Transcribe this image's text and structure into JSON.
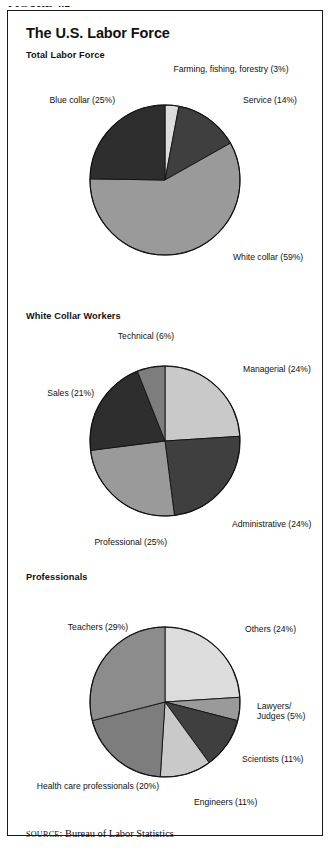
{
  "figure_kicker": "FIGURE 4.2",
  "title": "The U.S. Labor Force",
  "source": {
    "prefix": "SOURCE",
    "separator": ": ",
    "text": "Bureau of Labor Statistics"
  },
  "palette": {
    "very_light": "#dcdcdc",
    "light": "#c9c9c9",
    "medium": "#9a9a9a",
    "medium_dark": "#7d7d7d",
    "dark": "#3f3f3f",
    "very_dark": "#2e2e2e",
    "outline": "#111111"
  },
  "chart_data": [
    {
      "type": "pie",
      "title": "Total Labor Force",
      "start_angle": 0,
      "direction": "clockwise",
      "categories": [
        "Farming, fishing, forestry",
        "Service",
        "White collar",
        "Blue collar"
      ],
      "values": [
        3,
        14,
        59,
        25
      ],
      "labels": [
        "Farming, fishing, forestry (3%)",
        "Service (14%)",
        "White collar (59%)",
        "Blue collar (25%)"
      ],
      "colors": [
        "#dcdcdc",
        "#3f3f3f",
        "#9a9a9a",
        "#2e2e2e"
      ],
      "label_positions": [
        {
          "side": "center",
          "x": 136,
          "y": 2,
          "w": 190
        },
        {
          "side": "right",
          "x": 243,
          "y": 33,
          "w": 85
        },
        {
          "side": "right",
          "x": 233,
          "y": 190,
          "w": 95
        },
        {
          "side": "left",
          "x": 10,
          "y": 33,
          "w": 105
        }
      ]
    },
    {
      "type": "pie",
      "title": "White Collar Workers",
      "start_angle": 0,
      "direction": "clockwise",
      "categories": [
        "Managerial",
        "Administrative",
        "Professional",
        "Sales",
        "Technical"
      ],
      "values": [
        24,
        24,
        25,
        21,
        6
      ],
      "labels": [
        "Managerial (24%)",
        "Administrative (24%)",
        "Professional (25%)",
        "Sales (21%)",
        "Technical (6%)"
      ],
      "colors": [
        "#c9c9c9",
        "#3f3f3f",
        "#9a9a9a",
        "#2e2e2e",
        "#7d7d7d"
      ],
      "label_positions": [
        {
          "side": "right",
          "x": 243,
          "y": 41,
          "w": 88
        },
        {
          "side": "right",
          "x": 232,
          "y": 196,
          "w": 99
        },
        {
          "side": "left",
          "x": 64,
          "y": 214,
          "w": 103
        },
        {
          "side": "left",
          "x": 14,
          "y": 65,
          "w": 80
        },
        {
          "side": "center",
          "x": 86,
          "y": 8,
          "w": 120
        }
      ]
    },
    {
      "type": "pie",
      "title": "Professionals",
      "start_angle": 0,
      "direction": "clockwise",
      "categories": [
        "Others",
        "Lawyers/Judges",
        "Scientists",
        "Engineers",
        "Health care professionals",
        "Teachers"
      ],
      "values": [
        24,
        5,
        11,
        11,
        20,
        29
      ],
      "labels": [
        "Others (24%)",
        "Lawyers/\nJudges (5%)",
        "Scientists (11%)",
        "Engineers (11%)",
        "Health care professionals (20%)",
        "Teachers (29%)"
      ],
      "colors": [
        "#dcdcdc",
        "#9a9a9a",
        "#3f3f3f",
        "#c9c9c9",
        "#7d7d7d",
        "#8c8c8c"
      ],
      "label_positions": [
        {
          "side": "right",
          "x": 245,
          "y": 40,
          "w": 85
        },
        {
          "side": "right",
          "x": 257,
          "y": 117,
          "w": 72
        },
        {
          "side": "right",
          "x": 242,
          "y": 170,
          "w": 88
        },
        {
          "side": "right",
          "x": 194,
          "y": 213,
          "w": 100
        },
        {
          "side": "left",
          "x": 4,
          "y": 197,
          "w": 155
        },
        {
          "side": "left",
          "x": 40,
          "y": 38,
          "w": 88
        }
      ]
    }
  ],
  "geometry": {
    "cx": 165,
    "cy": 118,
    "r": 75
  }
}
